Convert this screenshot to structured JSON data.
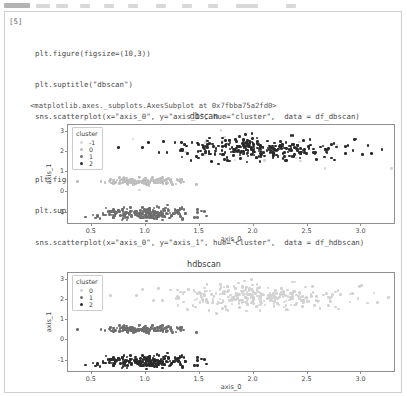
{
  "cell": {
    "prompt": "[5]",
    "code_lines": [
      "plt.figure(figsize=(10,3))",
      "plt.suptitle(\"dbscan\")",
      "sns.scatterplot(x=\"axis_0\", y=\"axis_1\", hue=\"cluster\",  data = df_dbscan)",
      "",
      "plt.figure(figsize=(10,3))",
      "plt.suptitle(\"hdbscan\")",
      "sns.scatterplot(x=\"axis_0\", y=\"axis_1\", hue=\"cluster\",  data = df_hdbscan)"
    ],
    "output_text": "<matplotlib.axes._subplots.AxesSubplot at 0x7fbba75a2fd0>"
  },
  "colors": {
    "cluster_minus1": "#d6d6d6",
    "cluster_0": "#bdbdbd",
    "cluster_1": "#6e6e6e",
    "cluster_2": "#2b2b2b",
    "axis_line": "#8e8e8e",
    "text": "#3c3c3c",
    "cell_border": "#cfcfcf"
  },
  "chart_data": [
    {
      "type": "scatter",
      "title": "dbscan",
      "xlabel": "axis_0",
      "ylabel": "axis_1",
      "xlim": [
        0.28,
        3.32
      ],
      "ylim": [
        -1.62,
        3.35
      ],
      "xticks": [
        "0.5",
        "1.0",
        "1.5",
        "2.0",
        "2.5",
        "3.0"
      ],
      "xtickvals": [
        0.5,
        1.0,
        1.5,
        2.0,
        2.5,
        3.0
      ],
      "yticks": [
        "3",
        "2",
        "1",
        "0",
        "-1"
      ],
      "ytickvals": [
        3,
        2,
        1,
        0,
        -1
      ],
      "grid": false,
      "legend": {
        "title": "cluster",
        "position": "upper-left",
        "entries": [
          {
            "label": "-1",
            "color": "#d6d6d6"
          },
          {
            "label": "0",
            "color": "#bdbdbd"
          },
          {
            "label": "1",
            "color": "#6e6e6e"
          },
          {
            "label": "2",
            "color": "#2b2b2b"
          }
        ]
      },
      "series": [
        {
          "name": "-1",
          "color": "#d6d6d6",
          "n": 26,
          "cx": 1.95,
          "cy": 2.1,
          "sx": 0.62,
          "sy": 0.72,
          "seed": 17
        },
        {
          "name": "0",
          "color": "#bdbdbd",
          "n": 150,
          "cx": 0.98,
          "cy": 0.55,
          "sx": 0.17,
          "sy": 0.09,
          "seed": 3
        },
        {
          "name": "1",
          "color": "#6e6e6e",
          "n": 210,
          "cx": 1.02,
          "cy": -1.05,
          "sx": 0.22,
          "sy": 0.14,
          "seed": 9
        },
        {
          "name": "2",
          "color": "#2b2b2b",
          "n": 290,
          "cx": 2.05,
          "cy": 2.12,
          "sx": 0.38,
          "sy": 0.27,
          "seed": 23
        }
      ]
    },
    {
      "type": "scatter",
      "title": "hdbscan",
      "xlabel": "axis_0",
      "ylabel": "axis_1",
      "xlim": [
        0.28,
        3.32
      ],
      "ylim": [
        -1.62,
        3.35
      ],
      "xticks": [
        "0.5",
        "1.0",
        "1.5",
        "2.0",
        "2.5",
        "3.0"
      ],
      "xtickvals": [
        0.5,
        1.0,
        1.5,
        2.0,
        2.5,
        3.0
      ],
      "yticks": [
        "3",
        "2",
        "1",
        "0",
        "-1"
      ],
      "ytickvals": [
        3,
        2,
        1,
        0,
        -1
      ],
      "grid": false,
      "legend": {
        "title": "cluster",
        "position": "upper-left",
        "entries": [
          {
            "label": "0",
            "color": "#d2d2d2"
          },
          {
            "label": "1",
            "color": "#6e6e6e"
          },
          {
            "label": "2",
            "color": "#2b2b2b"
          }
        ]
      },
      "series": [
        {
          "name": "0",
          "color": "#d2d2d2",
          "n": 300,
          "cx": 2.05,
          "cy": 2.12,
          "sx": 0.4,
          "sy": 0.3,
          "seed": 23
        },
        {
          "name": "1",
          "color": "#6e6e6e",
          "n": 150,
          "cx": 0.98,
          "cy": 0.55,
          "sx": 0.17,
          "sy": 0.09,
          "seed": 3
        },
        {
          "name": "2",
          "color": "#2b2b2b",
          "n": 215,
          "cx": 1.02,
          "cy": -1.05,
          "sx": 0.22,
          "sy": 0.14,
          "seed": 9
        }
      ]
    }
  ],
  "toolbar": {
    "visible_fragment": true
  }
}
